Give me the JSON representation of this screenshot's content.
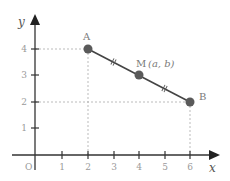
{
  "diagram": {
    "type": "coordinate-plane-segment-midpoint",
    "axes": {
      "x_label": "x",
      "y_label": "y",
      "origin_label": "O",
      "x_ticks": [
        "1",
        "2",
        "3",
        "4",
        "5",
        "6"
      ],
      "y_ticks": [
        "1",
        "2",
        "3",
        "4"
      ]
    },
    "points": {
      "A": {
        "label": "A",
        "x": 2,
        "y": 4
      },
      "M": {
        "label": "M",
        "coord_text": "(a, b)",
        "x": 4,
        "y": 3
      },
      "B": {
        "label": "B",
        "x": 6,
        "y": 2
      }
    },
    "segment": {
      "from": "A",
      "to": "B",
      "equal_marks": 2
    },
    "colors": {
      "axis": "#333333",
      "segment": "#444444",
      "point": "#5a5a5a",
      "guide": "#aaaaaa"
    }
  }
}
